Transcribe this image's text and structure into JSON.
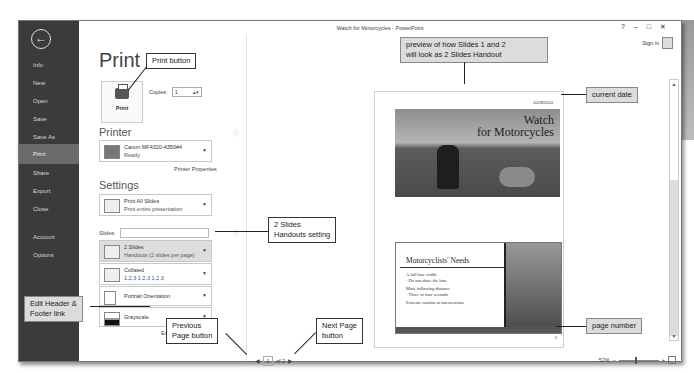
{
  "window": {
    "title": "Watch for Motorcycles - PowerPoint",
    "controls": {
      "help": "?",
      "minimize": "–",
      "restore": "□",
      "close": "✕"
    },
    "sign_in": "Sign in"
  },
  "sidebar": {
    "back_icon": "←",
    "items": [
      {
        "label": "Info"
      },
      {
        "label": "New"
      },
      {
        "label": "Open"
      },
      {
        "label": "Save"
      },
      {
        "label": "Save As"
      },
      {
        "label": "Print",
        "active": true
      },
      {
        "label": "Share"
      },
      {
        "label": "Export"
      },
      {
        "label": "Close"
      },
      {
        "label": "Account"
      },
      {
        "label": "Options"
      }
    ]
  },
  "print_panel": {
    "title": "Print",
    "print_button_label": "Print",
    "copies_label": "Copies:",
    "copies_value": "1",
    "printer_heading": "Printer",
    "printer": {
      "name": "Canon MF4320-4350#4",
      "status": "Ready"
    },
    "printer_properties_link": "Printer Properties",
    "settings_heading": "Settings",
    "settings": [
      {
        "title": "Print All Slides",
        "subtitle": "Print entire presentation"
      },
      {
        "title": "2 Slides",
        "subtitle": "Handouts (2 slides per page)",
        "selected": true
      },
      {
        "title": "Collated",
        "subtitle": "1,2,3   1,2,3   1,2,3"
      },
      {
        "title": "Portrait Orientation",
        "subtitle": ""
      },
      {
        "title": "Grayscale",
        "subtitle": ""
      }
    ],
    "slides_label": "Slides:",
    "slides_value": "",
    "edit_header_footer_link": "Edit Header & Footer"
  },
  "preview": {
    "date": "10/28/2014",
    "page_number": "1",
    "slide1": {
      "title_line1": "Watch",
      "title_line2": "for Motorcycles"
    },
    "slide2": {
      "title": "Motorcyclists' Needs",
      "bullets": [
        "A full lane width",
        "· Do not share the lane",
        "More following distance",
        "· Three or four seconds",
        "Extreme caution at intersections"
      ]
    },
    "pager": {
      "prev": "◀",
      "current": "1",
      "of_label": "of 2",
      "next": "▶"
    },
    "zoom": {
      "level": "52%",
      "minus": "–",
      "plus": "+"
    }
  },
  "callouts": {
    "print_button": "Print button",
    "preview": [
      "preview of how Slides 1 and 2",
      "will look as 2 Slides Handout"
    ],
    "current_date": "current date",
    "two_slides": [
      "2 Slides",
      "Handouts setting"
    ],
    "edit_header": [
      "Edit Header &",
      "Footer link"
    ],
    "previous_page": [
      "Previous",
      "Page button"
    ],
    "next_page": [
      "Next Page",
      "button"
    ],
    "page_number": "page number"
  }
}
